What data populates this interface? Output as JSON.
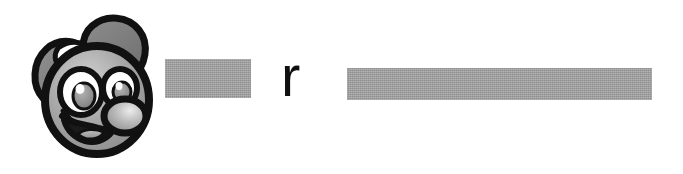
{
  "banner": {
    "background_color": "#ffffff",
    "visible_text": "r",
    "logo": {
      "name": "cartoon-bug-mascot-head",
      "description": "grayscale cartoon bug head with two large eyes, round nose, open smiling mouth and two wing-like ears",
      "outline_color": "#111111",
      "face_color": "#9b9b9b",
      "face_highlight_color": "#c9c9c9",
      "ear_color": "#7e7e7e",
      "eye_white_color": "#ffffff",
      "iris_color": "#8f8f8f",
      "nose_color": "#b5b5b5",
      "tongue_color": "#a3a3a3"
    },
    "redactions": [
      {
        "id": "redaction-bar-first",
        "label": "redacted text block",
        "color": "#9d9d9d",
        "width_px": 86,
        "height_px": 39
      },
      {
        "id": "redaction-bar-second",
        "label": "redacted text block",
        "color": "#9d9d9d",
        "width_px": 305,
        "height_px": 32
      }
    ],
    "letter": {
      "text": "r",
      "color": "#101010"
    }
  }
}
